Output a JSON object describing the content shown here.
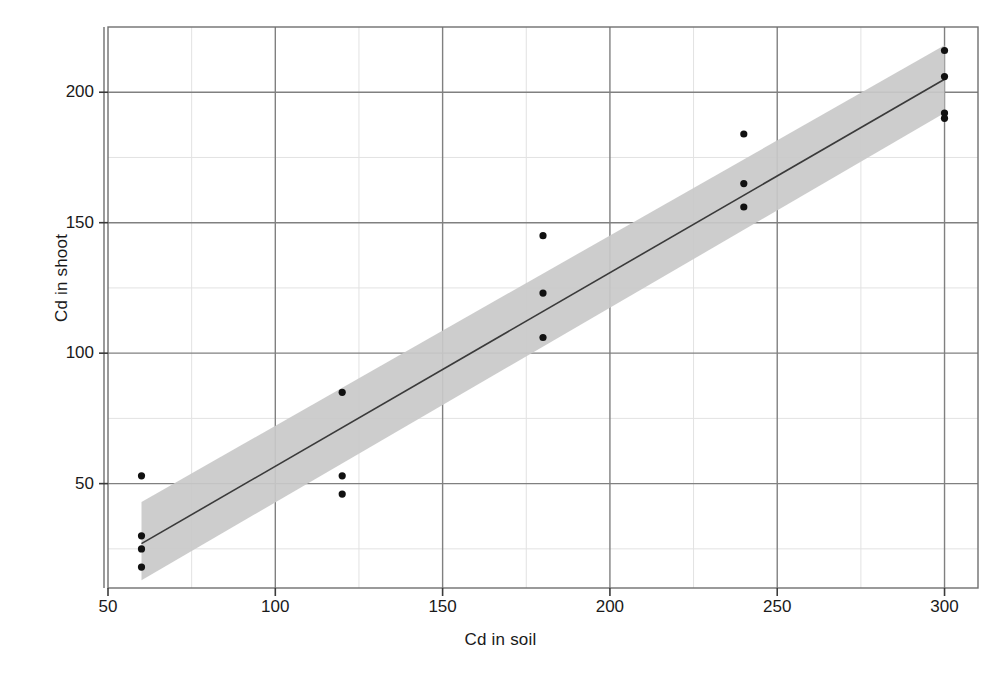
{
  "chart_data": {
    "type": "scatter",
    "title": "",
    "xlabel": "Cd in soil",
    "ylabel": "Cd in shoot",
    "xlim": [
      50,
      310
    ],
    "ylim": [
      10,
      225
    ],
    "xticks": [
      50,
      100,
      150,
      200,
      250,
      300
    ],
    "yticks": [
      50,
      100,
      150,
      200
    ],
    "grid": true,
    "minor_grid": true,
    "legend": "none",
    "points": [
      {
        "x": 60,
        "y": 53
      },
      {
        "x": 60,
        "y": 30
      },
      {
        "x": 60,
        "y": 25
      },
      {
        "x": 60,
        "y": 18
      },
      {
        "x": 120,
        "y": 85
      },
      {
        "x": 120,
        "y": 53
      },
      {
        "x": 120,
        "y": 46
      },
      {
        "x": 180,
        "y": 145
      },
      {
        "x": 180,
        "y": 123
      },
      {
        "x": 180,
        "y": 106
      },
      {
        "x": 240,
        "y": 184
      },
      {
        "x": 240,
        "y": 165
      },
      {
        "x": 240,
        "y": 156
      },
      {
        "x": 300,
        "y": 216
      },
      {
        "x": 300,
        "y": 206
      },
      {
        "x": 300,
        "y": 192
      },
      {
        "x": 300,
        "y": 190
      }
    ],
    "fit_line": {
      "label": "regression line",
      "x_start": 60,
      "y_start": 27,
      "x_end": 300,
      "y_end": 205
    },
    "confidence_band": {
      "label": "confidence band",
      "color": "#c9c9c9",
      "upper": [
        {
          "x": 60,
          "y": 43
        },
        {
          "x": 300,
          "y": 218
        }
      ],
      "lower": [
        {
          "x": 60,
          "y": 13
        },
        {
          "x": 300,
          "y": 192
        }
      ]
    },
    "colors": {
      "point": "#111111",
      "line": "#3a3a3a",
      "band": "#c9c9c9",
      "major_grid": "#808080",
      "minor_grid": "#e2e2e2",
      "axis": "#707070",
      "background": "#ffffff"
    }
  },
  "axes": {
    "x_title": "Cd in soil",
    "y_title": "Cd in shoot",
    "x_tick_labels": [
      "50",
      "100",
      "150",
      "200",
      "250",
      "300"
    ],
    "y_tick_labels": [
      "50",
      "100",
      "150",
      "200"
    ]
  }
}
